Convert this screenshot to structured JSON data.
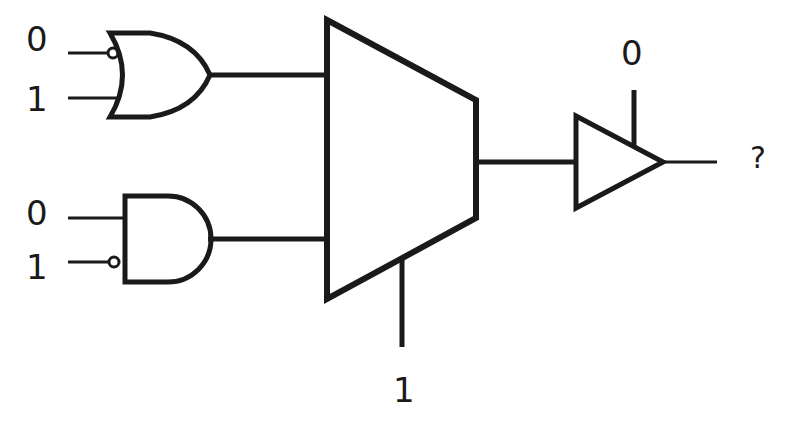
{
  "diagram": {
    "or_gate": {
      "type": "OR",
      "inputs": [
        {
          "label": "0",
          "inverted": true
        },
        {
          "label": "1",
          "inverted": false
        }
      ]
    },
    "and_gate": {
      "type": "AND",
      "inputs": [
        {
          "label": "0",
          "inverted": false
        },
        {
          "label": "1",
          "inverted": true
        }
      ]
    },
    "mux": {
      "type": "MUX 2:1",
      "select_label": "1"
    },
    "tristate_buffer": {
      "type": "Tri-state buffer",
      "enable_label": "0"
    },
    "output_label": "?",
    "stroke_color": "#1a1a1a"
  }
}
